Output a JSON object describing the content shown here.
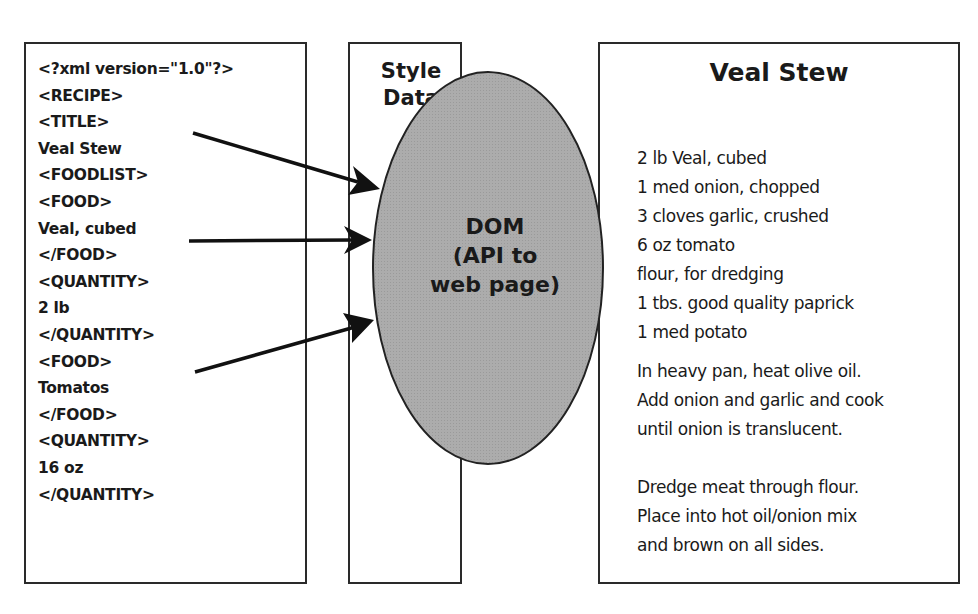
{
  "xml_panel": {
    "lines": [
      "<?xml version=\"1.0\"?>",
      "<RECIPE>",
      "<TITLE>",
      "Veal Stew",
      "<FOODLIST>",
      "<FOOD>",
      "Veal, cubed",
      "</FOOD>",
      "<QUANTITY>",
      "2 lb",
      "</QUANTITY>",
      "<FOOD>",
      "Tomatos",
      "</FOOD>",
      "<QUANTITY>",
      "16 oz",
      "</QUANTITY>"
    ]
  },
  "style_panel": {
    "title_line1": "Style",
    "title_line2": "Data"
  },
  "dom": {
    "line1": "DOM",
    "line2": "(API to",
    "line3": "web page)",
    "fill_color": "#a9a9a9"
  },
  "web_page": {
    "title": "Veal Stew",
    "ingredients": [
      "2 lb Veal, cubed",
      "1 med onion, chopped",
      "3 cloves garlic, crushed",
      "6 oz tomato",
      "flour, for dredging",
      "1 tbs. good quality paprick",
      "1 med potato"
    ],
    "steps": [
      [
        "In heavy pan, heat olive oil.",
        "Add onion and garlic and cook",
        "until onion is translucent."
      ],
      [
        "Dredge meat through flour.",
        "Place into hot oil/onion mix",
        "and brown on all sides."
      ]
    ]
  },
  "arrows": [
    {
      "from": "TITLE",
      "to": "DOM"
    },
    {
      "from": "Veal, cubed",
      "to": "DOM"
    },
    {
      "from": "FOOD (Tomatos)",
      "to": "DOM"
    }
  ]
}
